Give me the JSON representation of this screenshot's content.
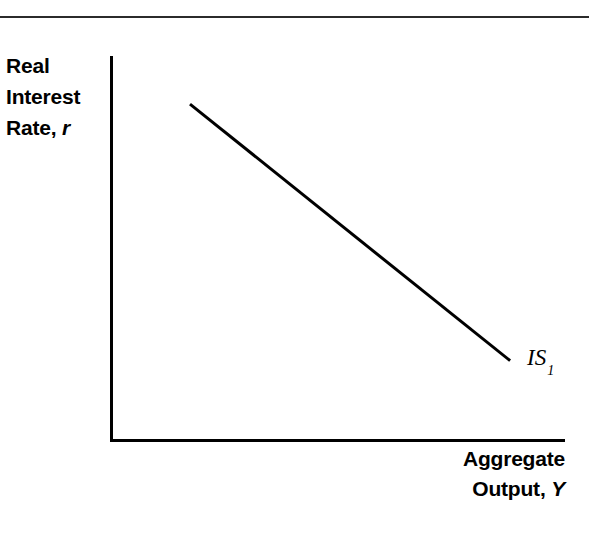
{
  "figure": {
    "background_color": "#ffffff",
    "ink_color": "#000000",
    "top_rule_color": "#2b2b2b"
  },
  "axes": {
    "y_title_line1": "Real",
    "y_title_line2": "Interest",
    "y_title_line3_text": "Rate,",
    "y_title_line3_var": "r",
    "x_title_line1": "Aggregate",
    "x_title_line2_text": "Output,",
    "x_title_line2_var": "Y"
  },
  "curve": {
    "label_text": "IS",
    "label_subscript": "1"
  },
  "chart_data": {
    "type": "line",
    "title": "",
    "subtitle": "",
    "xlabel": "Aggregate Output, Y",
    "ylabel": "Real Interest Rate, r",
    "grid": false,
    "legend_position": "inline-right-end",
    "xlim": [
      0,
      100
    ],
    "ylim": [
      0,
      100
    ],
    "axis_tick_labels": {
      "x": [],
      "y": []
    },
    "series": [
      {
        "name": "IS1",
        "annotation": "IS₁",
        "stroke_color": "#000000",
        "stroke_width": 3,
        "x": [
          17.4,
          87.9
        ],
        "y": [
          87.7,
          20.7
        ],
        "description": "Downward-sloping IS curve: higher aggregate output is associated with a lower real interest rate."
      }
    ],
    "annotations": [
      {
        "text": "IS₁",
        "x": 92.0,
        "y": 22.0,
        "anchor": "left"
      }
    ]
  }
}
